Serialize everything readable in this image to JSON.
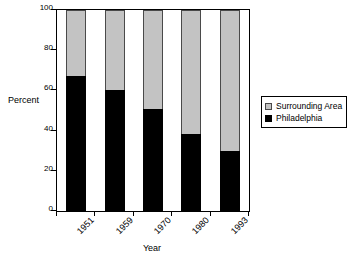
{
  "chart_data": {
    "type": "bar",
    "subtype": "stacked-100-percent",
    "title": "",
    "xlabel": "Year",
    "ylabel": "Percent",
    "categories": [
      "1951",
      "1959",
      "1970",
      "1980",
      "1993"
    ],
    "series": [
      {
        "name": "Philadelphia",
        "color": "#000000",
        "values": [
          67,
          60,
          51,
          38.5,
          30
        ]
      },
      {
        "name": "Surrounding Area",
        "color": "#c3c3c3",
        "values": [
          33,
          40,
          49,
          61.5,
          70
        ]
      }
    ],
    "ylim": [
      0,
      100
    ],
    "yticks": [
      0,
      20,
      40,
      60,
      80,
      100
    ],
    "ytick_labels": [
      "0",
      "20",
      "40",
      "60",
      "80",
      "100"
    ],
    "grid": false,
    "legend_position": "right",
    "legend_entries": [
      {
        "label": "Surrounding Area",
        "swatch": "gray"
      },
      {
        "label": "Philadelphia",
        "swatch": "black"
      }
    ],
    "xtick_label_rotation": -45
  }
}
